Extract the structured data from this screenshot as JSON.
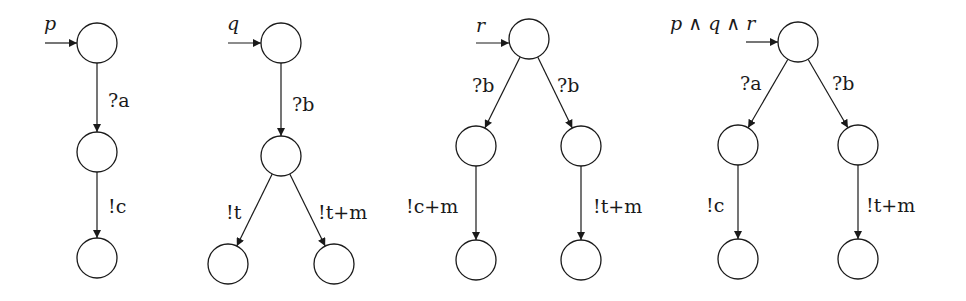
{
  "diagram": {
    "type": "automata",
    "node_radius": 20,
    "colors": {
      "stroke": "#1a1a1a",
      "background": "#ffffff"
    },
    "automata": [
      {
        "name": "p",
        "start_label": "p",
        "start_arrow": {
          "x1": 45,
          "y1": 43,
          "x2": 77,
          "y2": 43
        },
        "start_label_pos": {
          "x": 44,
          "y": 30
        },
        "nodes": [
          {
            "id": "p0",
            "x": 97,
            "y": 43
          },
          {
            "id": "p1",
            "x": 97,
            "y": 152
          },
          {
            "id": "p2",
            "x": 97,
            "y": 258
          }
        ],
        "edges": [
          {
            "from": "p0",
            "to": "p1",
            "label": "?a",
            "lx": 108,
            "ly": 107
          },
          {
            "from": "p1",
            "to": "p2",
            "label": "!c",
            "lx": 108,
            "ly": 213
          }
        ]
      },
      {
        "name": "q",
        "start_label": "q",
        "start_arrow": {
          "x1": 228,
          "y1": 43,
          "x2": 261,
          "y2": 43
        },
        "start_label_pos": {
          "x": 227,
          "y": 30
        },
        "nodes": [
          {
            "id": "q0",
            "x": 281,
            "y": 43
          },
          {
            "id": "q1",
            "x": 281,
            "y": 156
          },
          {
            "id": "q2",
            "x": 228,
            "y": 264
          },
          {
            "id": "q3",
            "x": 334,
            "y": 264
          }
        ],
        "edges": [
          {
            "from": "q0",
            "to": "q1",
            "label": "?b",
            "lx": 292,
            "ly": 111
          },
          {
            "from": "q1",
            "to": "q2",
            "label": "!t",
            "lx": 226,
            "ly": 219
          },
          {
            "from": "q1",
            "to": "q3",
            "label": "!t+m",
            "lx": 318,
            "ly": 219
          }
        ]
      },
      {
        "name": "r",
        "start_label": "r",
        "start_arrow": {
          "x1": 476,
          "y1": 43,
          "x2": 509,
          "y2": 43
        },
        "start_label_pos": {
          "x": 476,
          "y": 32
        },
        "nodes": [
          {
            "id": "r0",
            "x": 529,
            "y": 39
          },
          {
            "id": "r1",
            "x": 476,
            "y": 146
          },
          {
            "id": "r2",
            "x": 581,
            "y": 146
          },
          {
            "id": "r3",
            "x": 476,
            "y": 260
          },
          {
            "id": "r4",
            "x": 581,
            "y": 260
          }
        ],
        "edges": [
          {
            "from": "r0",
            "to": "r1",
            "label": "?b",
            "lx": 472,
            "ly": 92
          },
          {
            "from": "r0",
            "to": "r2",
            "label": "?b",
            "lx": 557,
            "ly": 92
          },
          {
            "from": "r1",
            "to": "r3",
            "label": "!c+m",
            "lx": 406,
            "ly": 213
          },
          {
            "from": "r2",
            "to": "r4",
            "label": "!t+m",
            "lx": 593,
            "ly": 213
          }
        ]
      },
      {
        "name": "p∧q∧r",
        "start_label": "p ∧ q ∧ r",
        "start_arrow": {
          "x1": 746,
          "y1": 42,
          "x2": 778,
          "y2": 42
        },
        "start_label_pos": {
          "x": 670,
          "y": 30
        },
        "nodes": [
          {
            "id": "s0",
            "x": 798,
            "y": 42
          },
          {
            "id": "s1",
            "x": 738,
            "y": 145
          },
          {
            "id": "s2",
            "x": 858,
            "y": 145
          },
          {
            "id": "s3",
            "x": 738,
            "y": 259
          },
          {
            "id": "s4",
            "x": 858,
            "y": 259
          }
        ],
        "edges": [
          {
            "from": "s0",
            "to": "s1",
            "label": "?a",
            "lx": 740,
            "ly": 90
          },
          {
            "from": "s0",
            "to": "s2",
            "label": "?b",
            "lx": 832,
            "ly": 90
          },
          {
            "from": "s1",
            "to": "s3",
            "label": "!c",
            "lx": 706,
            "ly": 212
          },
          {
            "from": "s2",
            "to": "s4",
            "label": "!t+m",
            "lx": 866,
            "ly": 212
          }
        ]
      }
    ]
  }
}
